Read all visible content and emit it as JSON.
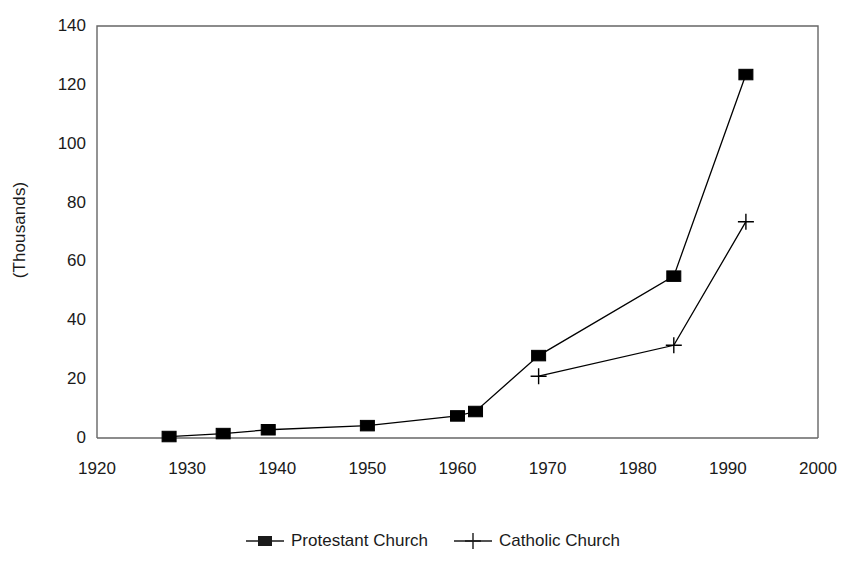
{
  "chart_data": {
    "type": "line",
    "title": "",
    "subtitle": "",
    "xlabel": "",
    "ylabel": "(Thousands)",
    "xlim": [
      1920,
      2000
    ],
    "ylim": [
      0,
      140
    ],
    "xticks": [
      1920,
      1930,
      1940,
      1950,
      1960,
      1970,
      1980,
      1990,
      2000
    ],
    "yticks": [
      0,
      20,
      40,
      60,
      80,
      100,
      120,
      140
    ],
    "grid": false,
    "legend_position": "bottom-center",
    "series": [
      {
        "name": "Protestant Church",
        "marker": "square",
        "color": "#000000",
        "points": [
          {
            "x": 1928,
            "y": 0.5
          },
          {
            "x": 1934,
            "y": 1.5
          },
          {
            "x": 1939,
            "y": 2.8
          },
          {
            "x": 1950,
            "y": 4.2
          },
          {
            "x": 1960,
            "y": 7.5
          },
          {
            "x": 1962,
            "y": 9.0
          },
          {
            "x": 1969,
            "y": 28.0
          },
          {
            "x": 1984,
            "y": 55.0
          },
          {
            "x": 1992,
            "y": 123.5
          }
        ]
      },
      {
        "name": "Catholic Church",
        "marker": "plus",
        "color": "#000000",
        "points": [
          {
            "x": 1969,
            "y": 21.0
          },
          {
            "x": 1984,
            "y": 31.5
          },
          {
            "x": 1992,
            "y": 73.5
          }
        ]
      }
    ]
  },
  "axis": {
    "y_title": "(Thousands)",
    "ytick_labels": [
      "0",
      "20",
      "40",
      "60",
      "80",
      "100",
      "120",
      "140"
    ],
    "xtick_labels": [
      "1920",
      "1930",
      "1940",
      "1950",
      "1960",
      "1970",
      "1980",
      "1990",
      "2000"
    ]
  },
  "legend": {
    "items": [
      {
        "label": "Protestant Church",
        "marker": "square-marker-icon"
      },
      {
        "label": "Catholic Church",
        "marker": "plus-marker-icon"
      }
    ]
  },
  "colors": {
    "line": "#1a1a1a",
    "axis": "#555555",
    "frame": "#666666",
    "text": "#1a1a1a",
    "background": "#ffffff"
  }
}
